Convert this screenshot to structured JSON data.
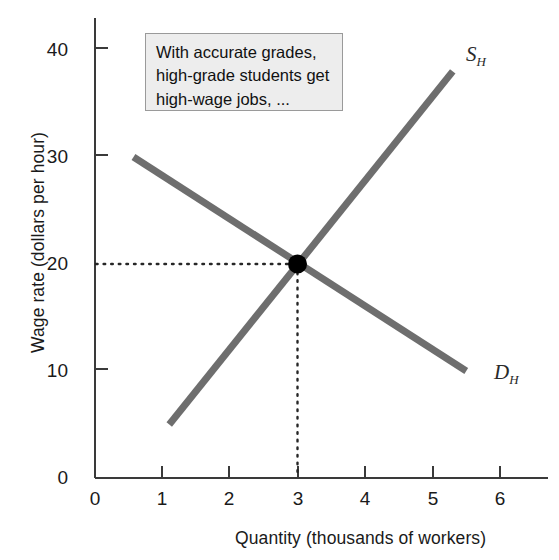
{
  "chart_data": {
    "type": "line",
    "title": "",
    "xlabel": "Quantity (thousands of workers)",
    "ylabel": "Wage rate (dollars per hour)",
    "xlim": [
      0,
      6.65
    ],
    "ylim": [
      0,
      42
    ],
    "xticks": [
      "0",
      "1",
      "2",
      "3",
      "4",
      "5",
      "6"
    ],
    "yticks": [
      "0",
      "10",
      "20",
      "30",
      "40"
    ],
    "grid": false,
    "legend_position": "inline-curve-labels",
    "series": [
      {
        "name": "S_H",
        "label": "S",
        "sublabel": "H",
        "description": "Supply of high-grade workers",
        "color": "#6e6e6e",
        "points": [
          [
            1.1,
            5.0
          ],
          [
            5.3,
            38.0
          ]
        ]
      },
      {
        "name": "D_H",
        "label": "D",
        "sublabel": "H",
        "description": "Demand for high-grade workers",
        "color": "#6e6e6e",
        "points": [
          [
            0.57,
            30.0
          ],
          [
            5.5,
            10.0
          ]
        ]
      }
    ],
    "equilibrium": {
      "x": 3,
      "y": 20,
      "marker_color": "#000000",
      "guide_style": "dotted"
    },
    "annotations": [
      {
        "name": "note",
        "lines": [
          "With accurate grades,",
          "high-grade students get",
          "high-wage jobs, ..."
        ],
        "background": "#ededed",
        "border_color": "#9a9a9a"
      }
    ]
  },
  "colors": {
    "curve": "#6e6e6e",
    "axis": "#3a3a3a",
    "marker": "#000000",
    "note_fill": "#ededed",
    "note_border": "#9a9a9a",
    "text": "#1a1a1a"
  }
}
